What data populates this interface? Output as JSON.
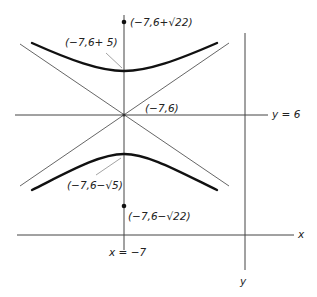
{
  "diagram": {
    "type": "hyperbola",
    "center": {
      "label": "(−7,6)",
      "x": -7,
      "y": 6
    },
    "vertices": [
      {
        "label": "(−7,6+ 5)",
        "position": "upper"
      },
      {
        "label": "(−7,6−√5)",
        "position": "lower"
      }
    ],
    "foci": [
      {
        "label": "(−7,6+√22)",
        "position": "upper"
      },
      {
        "label": "(−7,6−√22)",
        "position": "lower"
      }
    ],
    "lines": {
      "horizontal_label": "y = 6",
      "vertical_label": "x = −7"
    },
    "axes": {
      "x_label": "x",
      "y_label": "y"
    },
    "colors": {
      "curve": "#111111",
      "asymptote": "#555555",
      "axis": "#444444",
      "leader": "#999999",
      "background": "#ffffff"
    }
  }
}
